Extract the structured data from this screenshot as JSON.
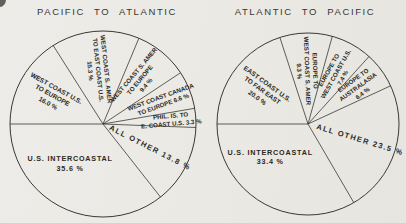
{
  "page": {
    "background": "#ebeae6",
    "ink": "#3a3832",
    "text_color": "#2b2924"
  },
  "chart_data": [
    {
      "type": "pie",
      "title": "PACIFIC TO ATLANTIC",
      "start_angle_deg": 180,
      "direction": "clockwise",
      "center_px": [
        103,
        124
      ],
      "radius_px": 93,
      "slices": [
        {
          "label": "WEST COAST U.S. TO EUROPE",
          "value": 16.0,
          "label_lines": [
            "WEST COAST U.S.",
            "TO EUROPE",
            "16.0 %"
          ],
          "label_angle_deg": 151,
          "label_r": 0.63,
          "label_rot_deg": 29,
          "label_size": 6.5
        },
        {
          "label": "WEST COAST S. AMER TO EAST COAST U.S.",
          "value": 15.3,
          "label_lines": [
            "WEST COAST S. AMER",
            "TO EAST COAST U.S.",
            "15.3 %"
          ],
          "label_angle_deg": 95,
          "label_r": 0.58,
          "label_rot_deg": 84,
          "label_size": 6.2
        },
        {
          "label": "WEST COAST S. AMER TO EUROPE",
          "value": 9.4,
          "label_lines": [
            "WEST COAST S. AMER",
            "TO EUROPE",
            "9.4 %"
          ],
          "label_angle_deg": 50,
          "label_r": 0.62,
          "label_rot_deg": -50,
          "label_size": 6.2
        },
        {
          "label": "WEST COAST CANADA TO EUROPE",
          "value": 6.6,
          "label_lines": [
            "WEST COAST CANADA",
            "TO EUROPE 6.6 %"
          ],
          "label_angle_deg": 21.5,
          "label_r": 0.68,
          "label_rot_deg": -20,
          "label_size": 6.2
        },
        {
          "label": "PHIL. IS. TO E. COAST U.S.",
          "value": 3.3,
          "label_lines": [
            "PHIL. IS. TO",
            "E. COAST U.S. 3.3 %"
          ],
          "label_angle_deg": 3.2,
          "label_r": 0.73,
          "label_rot_deg": -5,
          "label_size": 6.2
        },
        {
          "label": "ALL OTHER",
          "value": 13.8,
          "label_lines": [
            "ALL OTHER 13.8 %"
          ],
          "label_angle_deg": -27,
          "label_r": 0.57,
          "label_rot_deg": 27,
          "label_size": 7.5,
          "label_spacing": 1.4
        },
        {
          "label": "U.S. INTERCOASTAL",
          "value": 35.6,
          "label_lines": [
            "U.S. INTERCOASTAL",
            "35.6 %"
          ],
          "label_angle_deg": -130,
          "label_r": 0.55,
          "label_rot_deg": 0,
          "label_size": 7.2,
          "label_spacing": 0.8
        }
      ]
    },
    {
      "type": "pie",
      "title": "ATLANTIC TO PACIFIC",
      "start_angle_deg": 180,
      "direction": "clockwise",
      "center_px": [
        308,
        124
      ],
      "radius_px": 91,
      "slices": [
        {
          "label": "EAST COAST U.S. TO FAR EAST",
          "value": 20.0,
          "label_lines": [
            "EAST COAST U.S.",
            "TO FAR EAST",
            "20.0 %"
          ],
          "label_angle_deg": 144,
          "label_r": 0.62,
          "label_rot_deg": 36,
          "label_size": 6.5
        },
        {
          "label": "EUROPE TO WEST COAST S. AMER",
          "value": 9.3,
          "label_lines": [
            "EUROPE TO",
            "WEST COAST S. AMER",
            "9.3 %"
          ],
          "label_angle_deg": 91,
          "label_r": 0.58,
          "label_rot_deg": 88,
          "label_size": 6.2
        },
        {
          "label": "EUROPE TO WEST COAST U.S.",
          "value": 7.4,
          "label_lines": [
            "EUROPE TO",
            "WEST COAST U.S.",
            "7.4 %"
          ],
          "label_angle_deg": 61,
          "label_r": 0.63,
          "label_rot_deg": -61,
          "label_size": 6.2
        },
        {
          "label": "EUROPE TO AUSTRALASIA",
          "value": 6.4,
          "label_lines": [
            "EUROPE TO",
            "AUSTRALASIA",
            "6.4 %"
          ],
          "label_angle_deg": 36.4,
          "label_r": 0.68,
          "label_rot_deg": -36,
          "label_size": 6.2
        },
        {
          "label": "ALL OTHER",
          "value": 23.5,
          "label_lines": [
            "ALL OTHER 23.5 %"
          ],
          "label_angle_deg": -17.4,
          "label_r": 0.6,
          "label_rot_deg": 17,
          "label_size": 7.5,
          "label_spacing": 1.4
        },
        {
          "label": "U.S. INTERCOASTAL",
          "value": 33.4,
          "label_lines": [
            "U.S. INTERCOASTAL",
            "33.4 %"
          ],
          "label_angle_deg": -139,
          "label_r": 0.55,
          "label_rot_deg": 0,
          "label_size": 7.2,
          "label_spacing": 0.8
        }
      ]
    }
  ]
}
